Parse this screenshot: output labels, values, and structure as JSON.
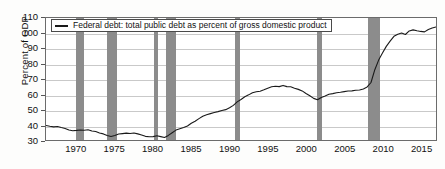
{
  "chart_data": {
    "type": "line",
    "title": "",
    "subtitle": "",
    "xlabel": "",
    "ylabel": "Percent of GDP",
    "xlim": [
      1966,
      2017
    ],
    "ylim": [
      30,
      110
    ],
    "yticks": [
      30,
      40,
      50,
      60,
      70,
      80,
      90,
      100,
      110
    ],
    "xticks": [
      1970,
      1975,
      1980,
      1985,
      1990,
      1995,
      2000,
      2005,
      2010,
      2015
    ],
    "grid": true,
    "legend_position": "top-left",
    "legend": [
      {
        "label": "Federal debt: total public debt as percent of gross domestic product",
        "color": "#1a1a1a",
        "marker": "line"
      }
    ],
    "series": [
      {
        "name": "Federal debt: total public debt as percent of gross domestic product",
        "color": "#1a1a1a",
        "units": "Percent of GDP",
        "x": [
          1966.0,
          1966.5,
          1967.0,
          1967.5,
          1968.0,
          1968.5,
          1969.0,
          1969.5,
          1970.0,
          1970.5,
          1971.0,
          1971.5,
          1972.0,
          1972.5,
          1973.0,
          1973.5,
          1974.0,
          1974.5,
          1975.0,
          1975.5,
          1976.0,
          1976.5,
          1977.0,
          1977.5,
          1978.0,
          1978.5,
          1979.0,
          1979.5,
          1980.0,
          1980.5,
          1981.0,
          1981.5,
          1982.0,
          1982.5,
          1983.0,
          1983.5,
          1984.0,
          1984.5,
          1985.0,
          1985.5,
          1986.0,
          1986.5,
          1987.0,
          1987.5,
          1988.0,
          1988.5,
          1989.0,
          1989.5,
          1990.0,
          1990.5,
          1991.0,
          1991.5,
          1992.0,
          1992.5,
          1993.0,
          1993.5,
          1994.0,
          1994.5,
          1995.0,
          1995.5,
          1996.0,
          1996.5,
          1997.0,
          1997.5,
          1998.0,
          1998.5,
          1999.0,
          1999.5,
          2000.0,
          2000.5,
          2001.0,
          2001.5,
          2002.0,
          2002.5,
          2003.0,
          2003.5,
          2004.0,
          2004.5,
          2005.0,
          2005.5,
          2006.0,
          2006.5,
          2007.0,
          2007.5,
          2008.0,
          2008.5,
          2009.0,
          2009.5,
          2010.0,
          2010.5,
          2011.0,
          2011.5,
          2012.0,
          2012.5,
          2013.0,
          2013.5,
          2014.0,
          2014.5,
          2015.0,
          2015.5,
          2016.0,
          2016.5,
          2017.0
        ],
        "y": [
          39.5,
          39.0,
          38.6,
          38.9,
          38.2,
          37.6,
          36.6,
          36.1,
          36.3,
          36.6,
          36.4,
          36.7,
          35.9,
          35.6,
          34.6,
          34.0,
          33.0,
          32.3,
          32.9,
          33.9,
          34.2,
          34.5,
          34.3,
          34.6,
          34.0,
          33.3,
          32.4,
          32.1,
          32.2,
          32.8,
          32.2,
          31.6,
          33.0,
          34.8,
          36.5,
          37.4,
          38.2,
          39.2,
          41.0,
          42.3,
          44.0,
          45.6,
          46.6,
          47.3,
          48.0,
          48.6,
          49.4,
          49.9,
          51.1,
          52.7,
          55.0,
          56.6,
          58.4,
          59.6,
          61.0,
          61.6,
          62.0,
          62.9,
          64.0,
          64.9,
          65.2,
          65.0,
          65.8,
          65.0,
          64.9,
          64.0,
          63.2,
          62.2,
          60.5,
          59.0,
          57.3,
          56.4,
          57.9,
          58.9,
          60.0,
          60.4,
          61.0,
          61.3,
          61.7,
          62.1,
          62.2,
          62.6,
          62.8,
          63.5,
          64.8,
          67.7,
          76.1,
          82.4,
          87.0,
          91.4,
          94.8,
          98.0,
          99.4,
          100.1,
          99.2,
          101.5,
          102.2,
          101.6,
          101.2,
          100.9,
          102.5,
          103.4,
          104.1
        ]
      }
    ],
    "recession_bands": [
      {
        "label": "1969-70 recession",
        "start": 1969.92,
        "end": 1970.92
      },
      {
        "label": "1973-75 recession",
        "start": 1973.92,
        "end": 1975.25
      },
      {
        "label": "1980 recession",
        "start": 1980.08,
        "end": 1980.58
      },
      {
        "label": "1981-82 recession",
        "start": 1981.58,
        "end": 1982.92
      },
      {
        "label": "1990-91 recession",
        "start": 1990.58,
        "end": 1991.25
      },
      {
        "label": "2001 recession",
        "start": 2001.25,
        "end": 2001.92
      },
      {
        "label": "2007-09 recession",
        "start": 2007.92,
        "end": 2009.5
      }
    ],
    "recession_color": "#8c8c8c",
    "gridline_color": "#c9c9c9",
    "axis_color": "#6b6b6b",
    "background_color": "#ffffff"
  }
}
